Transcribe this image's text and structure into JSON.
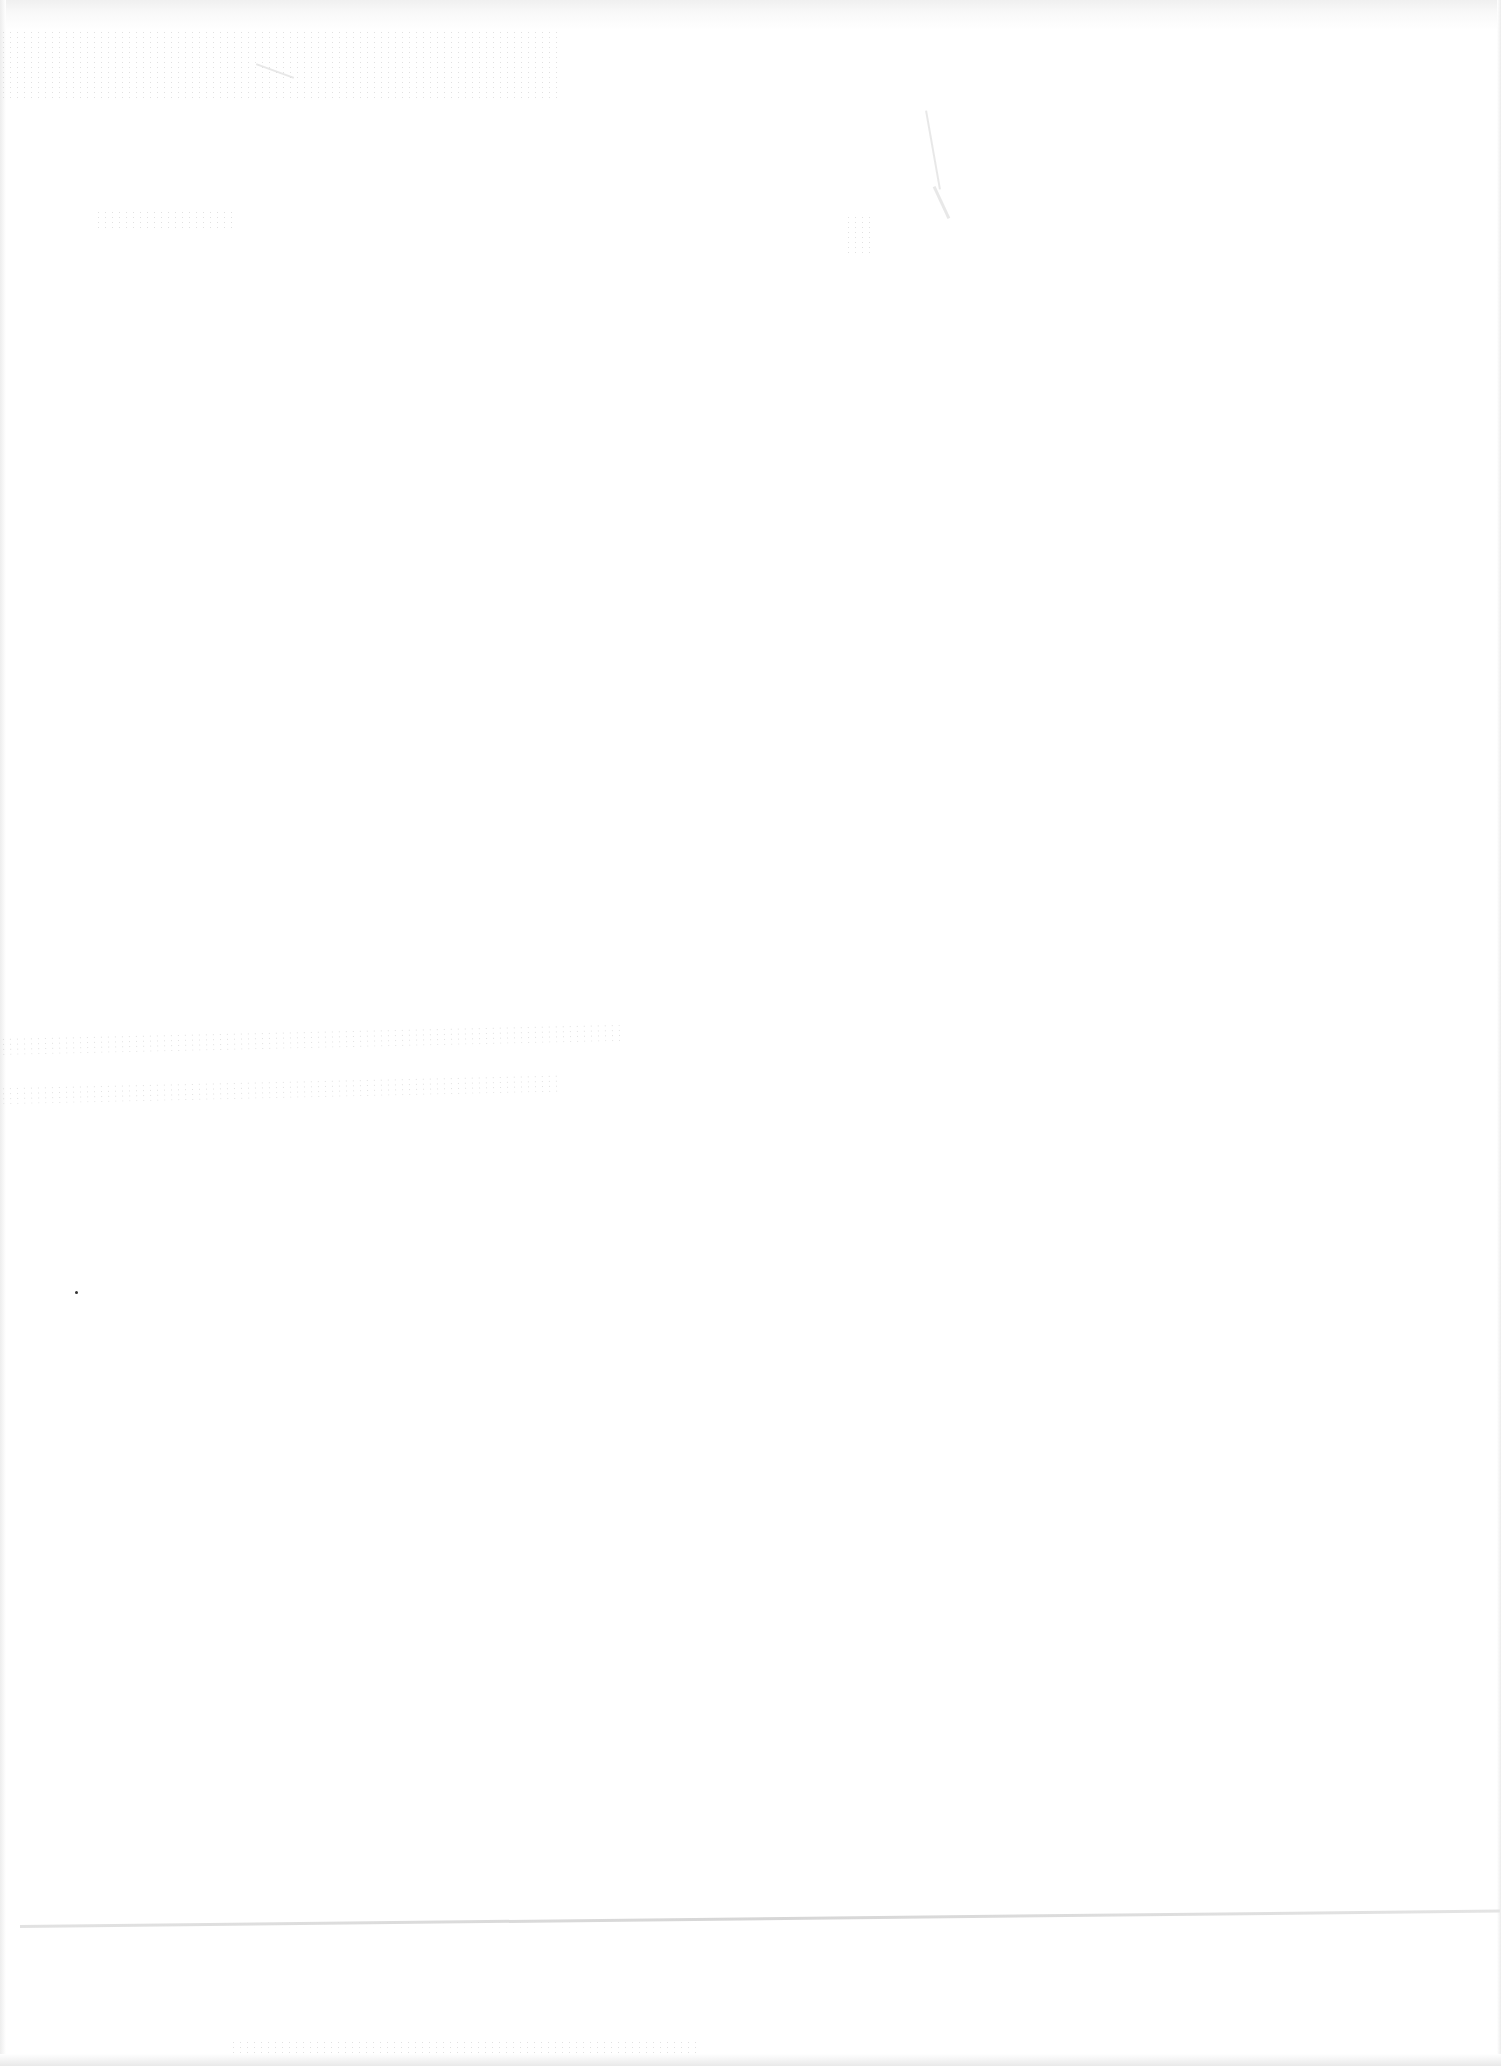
{
  "page": {
    "background_color": "#ffffff",
    "artifact_color": "#c9c9c9",
    "marks": [
      {
        "name": "top-left-speckle",
        "text": ""
      },
      {
        "name": "top-center-speckle",
        "text": ""
      },
      {
        "name": "mid-left-speckle-line-1",
        "text": ""
      },
      {
        "name": "mid-left-speckle-line-2",
        "text": ""
      },
      {
        "name": "bottom-speckle",
        "text": ""
      }
    ]
  }
}
